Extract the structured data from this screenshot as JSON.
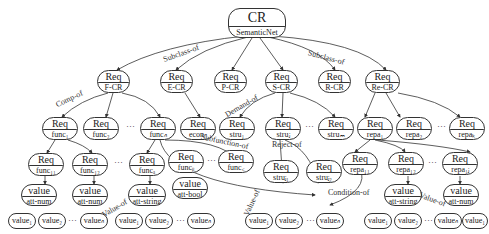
{
  "root": {
    "top": "CR",
    "bottom": "SemanticNet"
  },
  "level1": [
    {
      "top": "Req",
      "bottom": "F-CR"
    },
    {
      "top": "Req",
      "bottom": "E-CR"
    },
    {
      "top": "Req",
      "bottom": "P-CR"
    },
    {
      "top": "Req",
      "bottom": "S-CR"
    },
    {
      "top": "Req",
      "bottom": "R-CR"
    },
    {
      "top": "Req",
      "bottom": "Re-CR"
    }
  ],
  "level2": [
    {
      "top": "Req",
      "bottom": "func₁"
    },
    {
      "top": "Req",
      "bottom": "func₂"
    },
    {
      "top": "Req",
      "bottom": "funcₙ"
    },
    {
      "top": "Req",
      "bottom": "econₙ"
    },
    {
      "top": "Req",
      "bottom": "stru₁"
    },
    {
      "top": "Req",
      "bottom": "struⱼ"
    },
    {
      "top": "Req",
      "bottom": "struₘ"
    },
    {
      "top": "Req",
      "bottom": "repa₁"
    },
    {
      "top": "Req",
      "bottom": "repa₂"
    },
    {
      "top": "Req",
      "bottom": "repaₖ"
    }
  ],
  "level3": [
    {
      "top": "Req",
      "bottom": "func₁₁"
    },
    {
      "top": "Req",
      "bottom": "func₁₂"
    },
    {
      "top": "Req",
      "bottom": "funcₐ"
    },
    {
      "top": "Req",
      "bottom": "funcᵦ"
    },
    {
      "top": "Req",
      "bottom": "func꜀"
    },
    {
      "top": "Req",
      "bottom": "struⱼ₁"
    },
    {
      "top": "Req",
      "bottom": "struⱼ₂"
    },
    {
      "top": "Req",
      "bottom": "repa₁₁"
    },
    {
      "top": "Req",
      "bottom": "repa₁₂"
    },
    {
      "top": "Req",
      "bottom": "repa₁ⱼ"
    }
  ],
  "attributes": [
    {
      "top": "value",
      "bottom": "att-num"
    },
    {
      "top": "value",
      "bottom": "att-num"
    },
    {
      "top": "value",
      "bottom": "att-string"
    },
    {
      "top": "value",
      "bottom": "att-bool"
    },
    {
      "top": "value",
      "bottom": "att-string"
    },
    {
      "top": "value",
      "bottom": "att-num"
    }
  ],
  "values": [
    "value₁",
    "value₂",
    "valueₙ",
    "value₁",
    "value₂",
    "valueₙ",
    "value₁",
    "value₂",
    "valueₙ",
    "value₁",
    "value₂",
    "valueₙ",
    "value₁"
  ],
  "edge_labels": {
    "subclass_left": "Subclass-of",
    "subclass_right": "Subclass-of",
    "comp_of": "Comp-of",
    "demand_of": "Demand-of",
    "subfunction_of": "Subfunction-of",
    "reject_of": "Reject-of",
    "condition_of": "Condition-of",
    "value_of_1": "Value-of",
    "value_of_2": "Value-of",
    "value_of_3": "Value-of"
  },
  "ellipsis": "···"
}
